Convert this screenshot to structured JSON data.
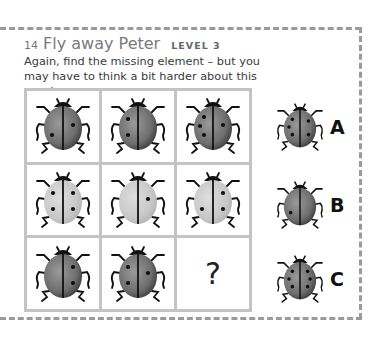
{
  "puzzle": {
    "number": "14",
    "title": "Fly away Peter",
    "level": "LEVEL 3",
    "description": "Again, find the missing element – but you may have to think a bit harder about this puzzle.",
    "missing_symbol": "?"
  },
  "grid": [
    [
      {
        "shade": "dark",
        "dots_left": 1,
        "dots_right": 1
      },
      {
        "shade": "dark",
        "dots_left": 2,
        "dots_right": 0
      },
      {
        "shade": "dark",
        "dots_left": 3,
        "dots_right": 1
      }
    ],
    [
      {
        "shade": "light",
        "dots_left": 2,
        "dots_right": 2
      },
      {
        "shade": "light",
        "dots_left": 0,
        "dots_right": 1
      },
      {
        "shade": "light",
        "dots_left": 1,
        "dots_right": 2
      }
    ],
    [
      {
        "shade": "dark",
        "dots_left": 0,
        "dots_right": 2
      },
      {
        "shade": "dark",
        "dots_left": 2,
        "dots_right": 1
      },
      {
        "missing": true
      }
    ]
  ],
  "options": [
    {
      "label": "A",
      "shade": "dark",
      "dots_left": 3,
      "dots_right": 2
    },
    {
      "label": "B",
      "shade": "dark",
      "dots_left": 1,
      "dots_right": 0
    },
    {
      "label": "C",
      "shade": "dark",
      "dots_left": 3,
      "dots_right": 3
    }
  ],
  "colors": {
    "dark_shell": "#6e6e6e",
    "light_shell": "#c9c9c9",
    "frame": "#9a9a9a"
  }
}
